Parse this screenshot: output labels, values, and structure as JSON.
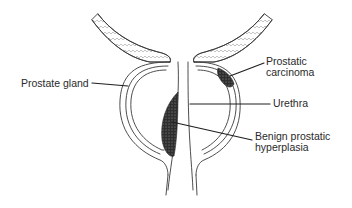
{
  "figure": {
    "type": "anatomical-illustration",
    "colors": {
      "line": "#3a3a3a",
      "bph_fill": "#3c3c3c",
      "carcinoma_fill": "#3c3c3c",
      "background": "#ffffff"
    }
  },
  "labels": {
    "prostate_gland": "Prostate gland",
    "prostatic_carcinoma": "Prostatic\ncarcinoma",
    "urethra": "Urethra",
    "benign_prostatic_hyperplasia": "Benign prostatic\nhyperplasia"
  }
}
